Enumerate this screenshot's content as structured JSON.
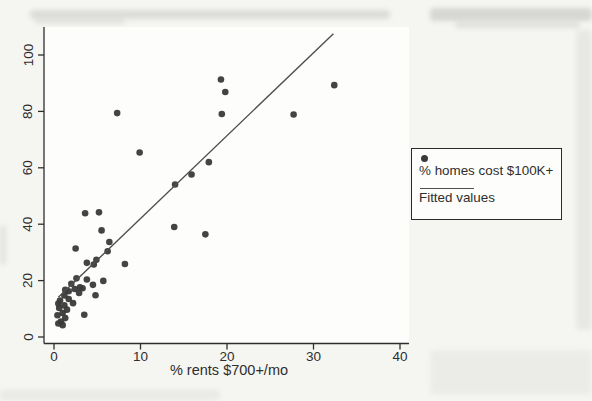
{
  "chart_data": {
    "type": "scatter",
    "title": "",
    "xlabel": "% rents $700+/mo",
    "ylabel": "",
    "xlim": [
      0,
      40
    ],
    "ylim": [
      0,
      100
    ],
    "x_tick_labels": [
      "0",
      "10",
      "20",
      "30",
      "40"
    ],
    "x_tick_values": [
      0,
      10,
      20,
      30,
      40
    ],
    "y_tick_labels": [
      "0",
      "20",
      "40",
      "60",
      "80",
      "100"
    ],
    "y_tick_values": [
      0,
      20,
      40,
      60,
      80,
      100
    ],
    "grid": false,
    "legend": {
      "position": "outside-right",
      "entries": [
        {
          "marker": "dot",
          "label": "% homes cost $100K+"
        },
        {
          "marker": "line",
          "label": "Fitted values"
        }
      ]
    },
    "series": [
      {
        "name": "% homes cost $100K+",
        "type": "scatter",
        "points": [
          [
            7.3,
            79.4
          ],
          [
            9.9,
            65.4
          ],
          [
            19.3,
            91.3
          ],
          [
            19.8,
            86.9
          ],
          [
            19.4,
            79.1
          ],
          [
            27.7,
            78.9
          ],
          [
            32.4,
            89.3
          ],
          [
            17.9,
            62.0
          ],
          [
            15.9,
            57.6
          ],
          [
            14.0,
            54.1
          ],
          [
            13.9,
            39.0
          ],
          [
            17.5,
            36.4
          ],
          [
            3.6,
            43.9
          ],
          [
            5.2,
            44.2
          ],
          [
            5.5,
            37.8
          ],
          [
            6.4,
            33.7
          ],
          [
            2.5,
            31.4
          ],
          [
            6.2,
            30.4
          ],
          [
            4.9,
            27.4
          ],
          [
            3.8,
            26.3
          ],
          [
            8.2,
            25.9
          ],
          [
            4.6,
            25.7
          ],
          [
            5.7,
            19.9
          ],
          [
            4.5,
            18.5
          ],
          [
            3.8,
            20.4
          ],
          [
            3.0,
            17.6
          ],
          [
            2.4,
            17.0
          ],
          [
            2.9,
            15.6
          ],
          [
            3.3,
            17.3
          ],
          [
            2.0,
            18.9
          ],
          [
            2.6,
            20.8
          ],
          [
            1.7,
            16.2
          ],
          [
            1.3,
            16.7
          ],
          [
            1.2,
            14.7
          ],
          [
            4.8,
            14.8
          ],
          [
            1.7,
            13.5
          ],
          [
            0.7,
            12.9
          ],
          [
            2.2,
            12.0
          ],
          [
            1.2,
            11.2
          ],
          [
            0.6,
            10.3
          ],
          [
            1.5,
            9.7
          ],
          [
            1.0,
            8.5
          ],
          [
            0.4,
            7.7
          ],
          [
            1.3,
            6.7
          ],
          [
            0.8,
            5.5
          ],
          [
            3.5,
            7.9
          ],
          [
            0.5,
            11.9
          ],
          [
            0.5,
            4.8
          ],
          [
            1.0,
            4.2
          ]
        ]
      },
      {
        "name": "Fitted values",
        "type": "line-fit",
        "slope": 2.94,
        "intercept": 12.6,
        "x_start": 0.5,
        "x_end": 32.3
      }
    ],
    "colors": {
      "marker": "#3a3a3a",
      "fitted_line": "#4f4f4f",
      "axis": "#2e2e2e",
      "text": "#2e2e2e",
      "legend_border": "#2a2a2a",
      "page_background": "#f5f5f2",
      "plot_background": "#fdfdfb",
      "scan_smudge": "#b8b8b4"
    }
  }
}
